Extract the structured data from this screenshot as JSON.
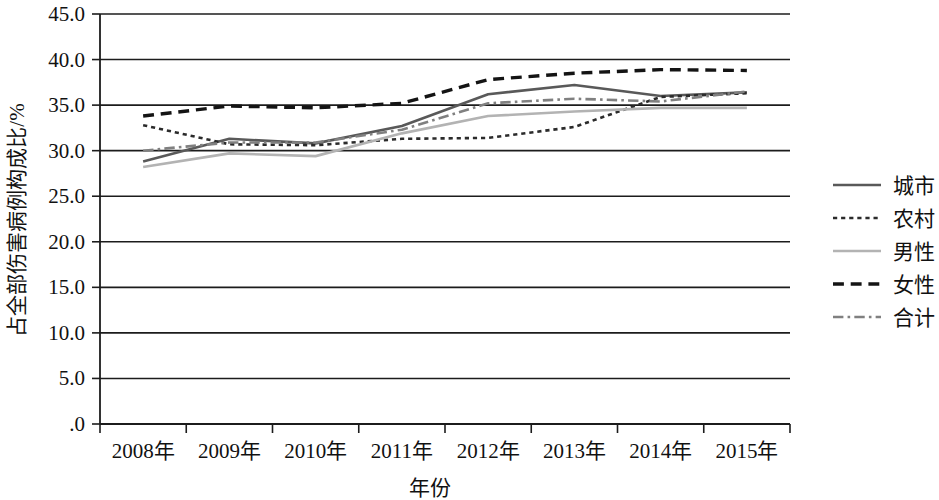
{
  "chart_data": {
    "type": "line",
    "title": "",
    "xlabel": "年份",
    "ylabel": "占全部伤害病例构成比/%",
    "categories": [
      "2008年",
      "2009年",
      "2010年",
      "2011年",
      "2012年",
      "2013年",
      "2014年",
      "2015年"
    ],
    "ylim": [
      0,
      45
    ],
    "ytick_labels": [
      "45.0",
      "40.0",
      "35.0",
      "30.0",
      "25.0",
      "20.0",
      "15.0",
      "10.0",
      "5.0",
      ".0"
    ],
    "ytick_values": [
      45,
      40,
      35,
      30,
      25,
      20,
      15,
      10,
      5,
      0
    ],
    "ytick_step": 5,
    "grid": true,
    "grid_axis": "y",
    "legend_position": "right",
    "series": [
      {
        "name": "城市",
        "style": "solid",
        "color": "#595959",
        "width": 2.6,
        "values": [
          28.8,
          31.3,
          30.8,
          32.7,
          36.2,
          37.2,
          36.0,
          36.4
        ]
      },
      {
        "name": "农村",
        "style": "dotted",
        "color": "#2b2b2b",
        "width": 2.6,
        "values": [
          32.8,
          30.7,
          30.6,
          31.3,
          31.4,
          32.6,
          35.9,
          36.3
        ]
      },
      {
        "name": "男性",
        "style": "solid",
        "color": "#b3b3b3",
        "width": 2.6,
        "values": [
          28.2,
          29.7,
          29.4,
          31.9,
          33.8,
          34.3,
          34.7,
          34.7
        ]
      },
      {
        "name": "女性",
        "style": "dashed",
        "color": "#141414",
        "width": 3.4,
        "values": [
          33.8,
          34.9,
          34.7,
          35.2,
          37.8,
          38.5,
          38.9,
          38.8
        ]
      },
      {
        "name": "合计",
        "style": "dashdot",
        "color": "#808080",
        "width": 2.6,
        "values": [
          30.0,
          30.9,
          30.9,
          32.3,
          35.2,
          35.7,
          35.4,
          36.5
        ]
      }
    ]
  },
  "legend": {
    "items": [
      {
        "label": "城市"
      },
      {
        "label": "农村"
      },
      {
        "label": "男性"
      },
      {
        "label": "女性"
      },
      {
        "label": "合计"
      }
    ]
  },
  "axes": {
    "y_title": "占全部伤害病例构成比/%",
    "x_title": "年份"
  }
}
